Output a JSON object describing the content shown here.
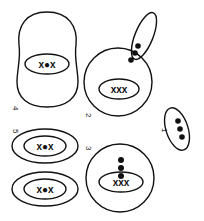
{
  "diagram": {
    "stroke_color": "#111111",
    "background": "#ffffff",
    "figures": [
      {
        "id": "1",
        "label": "1",
        "inner_marks": "●●●",
        "shape": "tilted-ellipse"
      },
      {
        "id": "2",
        "label": "2",
        "inner_marks": "xxx",
        "lobe_marks": "●●●",
        "shape": "circle-with-lobe"
      },
      {
        "id": "3",
        "label": "3",
        "inner_marks": "xxx",
        "dots": "●●●",
        "shape": "circle"
      },
      {
        "id": "4",
        "label": "4",
        "inner_marks": "x●x",
        "shape": "tall-oval"
      },
      {
        "id": "5a",
        "label": "5",
        "inner_marks": "x●x",
        "shape": "double-ellipse"
      },
      {
        "id": "5b",
        "label": "",
        "inner_marks": "x●x",
        "shape": "double-ellipse"
      }
    ]
  }
}
